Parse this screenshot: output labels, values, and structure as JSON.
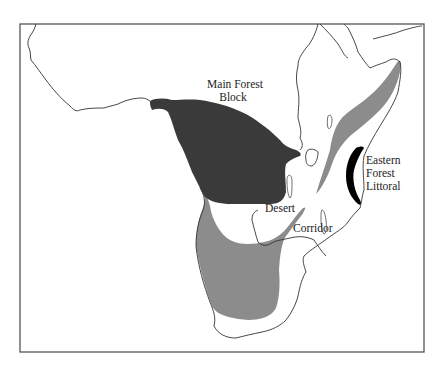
{
  "figure": {
    "type": "map",
    "region": "Sub-Saharan Africa",
    "colors": {
      "background": "#ffffff",
      "frame": "#555555",
      "coastline": "#333333",
      "main_forest": "#3a3a3a",
      "arid_zone": "#8c8c8c",
      "eastern_littoral": "#000000"
    }
  },
  "labels": {
    "main_forest_line1": "Main Forest",
    "main_forest_line2": "Block",
    "eastern_line1": "Eastern",
    "eastern_line2": "Forest",
    "eastern_line3": "Littoral",
    "desert": "Desert",
    "corridor": "Corridor"
  },
  "legend_regions": [
    {
      "name": "Main Forest Block",
      "fill": "dark grey"
    },
    {
      "name": "Eastern Forest Littoral",
      "fill": "black"
    },
    {
      "name": "Desert Corridor",
      "fill": "medium grey"
    }
  ]
}
